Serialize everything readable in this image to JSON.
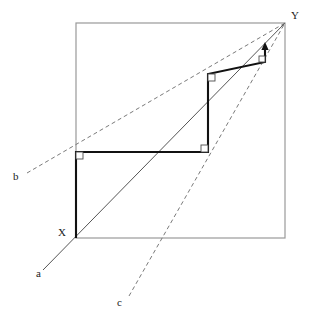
{
  "figure": {
    "canvas": {
      "width": 312,
      "height": 322,
      "background": "#ffffff"
    },
    "colors": {
      "frame": "#999999",
      "solid_line": "#555555",
      "bold_path": "#111111",
      "dashed_line": "#7a7a7a",
      "label_text": "#1a1a1a",
      "right_angle_mark": "#4d4d4d"
    },
    "bounding_square": {
      "name": "outer-square",
      "x": 76,
      "y": 23,
      "width": 209,
      "height": 215,
      "stroke_width": 1.2
    },
    "points": [
      {
        "id": "X",
        "label": "X",
        "x": 76,
        "y": 238,
        "label_x": 58,
        "label_y": 227
      },
      {
        "id": "Y",
        "label": "Y",
        "x": 285,
        "y": 23,
        "label_x": 291,
        "label_y": 10
      }
    ],
    "rays": [
      {
        "id": "a",
        "label": "a",
        "style": "solid",
        "x1": 43,
        "y1": 270,
        "x2": 285,
        "y2": 23,
        "label_x": 36,
        "label_y": 268
      },
      {
        "id": "b",
        "label": "b",
        "style": "dashed",
        "x1": 27,
        "y1": 173,
        "x2": 285,
        "y2": 23,
        "label_x": 13,
        "label_y": 171
      },
      {
        "id": "c",
        "label": "c",
        "style": "dashed",
        "x1": 129,
        "y1": 296,
        "x2": 285,
        "y2": 23,
        "label_x": 117,
        "label_y": 297
      }
    ],
    "spiral_path": {
      "name": "right-angle-spiral",
      "stroke_width": 2.1,
      "vertices": [
        {
          "x": 76,
          "y": 238
        },
        {
          "x": 76,
          "y": 152
        },
        {
          "x": 208,
          "y": 152
        },
        {
          "x": 208,
          "y": 74
        },
        {
          "x": 265,
          "y": 62
        },
        {
          "x": 265,
          "y": 46
        }
      ],
      "arrow_at": {
        "x": 265,
        "y": 46,
        "direction": "up"
      }
    },
    "right_angle_marks": [
      {
        "id": "ra-1",
        "x": 76,
        "y": 152,
        "dx": 1,
        "dy": 1,
        "size": 7
      },
      {
        "id": "ra-2",
        "x": 208,
        "y": 152,
        "dx": -1,
        "dy": -1,
        "size": 7
      },
      {
        "id": "ra-3",
        "x": 208,
        "y": 74,
        "dx": 1,
        "dy": 1,
        "size": 7
      },
      {
        "id": "ra-4",
        "x": 265,
        "y": 62,
        "dx": -1,
        "dy": -1,
        "size": 6
      }
    ]
  }
}
